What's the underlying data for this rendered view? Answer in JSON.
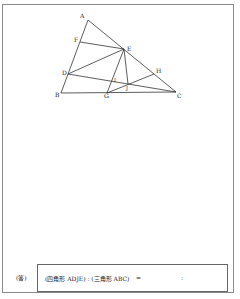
{
  "figure": {
    "points": {
      "A": {
        "label": "A",
        "x": 88,
        "y": 20
      },
      "B": {
        "label": "B",
        "x": 61,
        "y": 93
      },
      "C": {
        "label": "C",
        "x": 176,
        "y": 92
      },
      "D": {
        "label": "D",
        "x": 68,
        "y": 74
      },
      "E": {
        "label": "E",
        "x": 124,
        "y": 49
      },
      "F": {
        "label": "F",
        "x": 80,
        "y": 42
      },
      "G": {
        "label": "G",
        "x": 107,
        "y": 93
      },
      "H": {
        "label": "H",
        "x": 154,
        "y": 74
      },
      "I": {
        "label": "I",
        "x": 113,
        "y": 81
      },
      "J": {
        "label": "J",
        "x": 128,
        "y": 84
      }
    },
    "segments": [
      "AB",
      "BC",
      "AC",
      "FE",
      "DE",
      "DC",
      "EG",
      "EJ",
      "GH"
    ]
  },
  "answer": {
    "label": "(答)",
    "expression": "(四角形 ADJE) : (三角形 ABC)",
    "equals": "=",
    "colon": ":"
  }
}
